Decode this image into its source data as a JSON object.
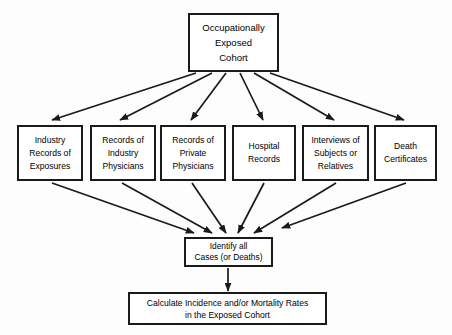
{
  "diagram": {
    "background_color": "#fdfdfd",
    "line_color": "#1a1a1a",
    "box_fill": "#ffffff",
    "text_color": "#000000"
  },
  "cohort": {
    "line1": "Occupationally",
    "line2": "Exposed",
    "line3": "Cohort"
  },
  "sources": [
    {
      "line1": "Industry",
      "line2": "Records of",
      "line3": "Exposures"
    },
    {
      "line1": "Records of",
      "line2": "Industry",
      "line3": "Physicians"
    },
    {
      "line1": "Records of",
      "line2": "Private",
      "line3": "Physicians"
    },
    {
      "line1": "Hospital",
      "line2": "Records",
      "line3": ""
    },
    {
      "line1": "Interviews of",
      "line2": "Subjects or",
      "line3": "Relatives"
    },
    {
      "line1": "Death",
      "line2": "Certificates",
      "line3": ""
    }
  ],
  "identify": {
    "line1": "Identify all",
    "line2": "Cases (or Deaths)"
  },
  "calculate": {
    "line1": "Calculate Incidence and/or Mortality Rates",
    "line2": "in the Exposed Cohort"
  },
  "connectors": {
    "fan_out_label": "cohort-to-sources-arrows",
    "fan_in_label": "sources-to-identify-arrows",
    "vertical_label": "identify-to-calculate-arrow",
    "fan_out_count": 6,
    "fan_in_count": 6
  }
}
